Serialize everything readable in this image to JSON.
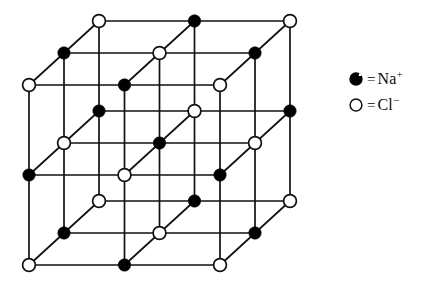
{
  "figure": {
    "background_color": "#ffffff",
    "line_color": "#111111",
    "cation_color": "#000000",
    "anion_fill_color": "#ffffff",
    "anion_stroke_color": "#111111"
  },
  "legend": {
    "equals_sign": "=",
    "items": [
      {
        "marker": "filled-circle-icon",
        "marker_style": "filled",
        "species": "Na",
        "charge": "+",
        "label": "Na+"
      },
      {
        "marker": "open-circle-icon",
        "marker_style": "open",
        "species": "Cl",
        "charge": "−",
        "label": "Cl−"
      }
    ]
  },
  "lattice": {
    "type": "rock-salt-cubic",
    "grid_size": [
      3,
      3,
      3
    ],
    "node_count": 27,
    "front_face": {
      "top_left": [
        29,
        85
      ],
      "top_right": [
        220,
        85
      ],
      "bottom_right": [
        220,
        265
      ],
      "bottom_left": [
        29,
        265
      ]
    },
    "depth_offset": [
      70,
      -64
    ],
    "node_radius_cation": 6.2,
    "node_radius_anion": 6.4,
    "parity_rule": "sum of indices even = Cl- (open), odd = Na+ (filled)",
    "edge_width": 1.7,
    "species_at_front_top_left": "Cl-"
  },
  "chart_data": {
    "type": "diagram",
    "legend": [
      "Na+",
      "Cl-"
    ]
  }
}
